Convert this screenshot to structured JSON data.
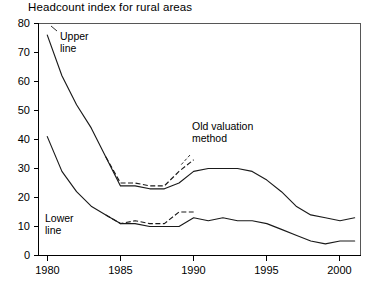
{
  "chart_data": {
    "type": "line",
    "title": "Headcount index for rural areas",
    "xlabel": "",
    "ylabel": "",
    "xlim": [
      1979.4,
      2001.4
    ],
    "ylim": [
      0,
      80
    ],
    "xticks": [
      1980,
      1985,
      1990,
      1995,
      2000
    ],
    "yticks": [
      0,
      10,
      20,
      30,
      40,
      50,
      60,
      70,
      80
    ],
    "grid": false,
    "legend_position": "none",
    "annotations": [
      {
        "text_line1": "Upper",
        "text_line2": "line",
        "x": 1981.0,
        "y": 73
      },
      {
        "text_line1": "Old valuation",
        "text_line2": "method",
        "x": 1989.5,
        "y": 44
      },
      {
        "text_line1": "Lower",
        "text_line2": "line",
        "x": 1980.8,
        "y": 11
      }
    ],
    "series": [
      {
        "name": "Upper line",
        "style": "solid",
        "x": [
          1980,
          1981,
          1982,
          1983,
          1984,
          1985,
          1986,
          1987,
          1988,
          1989,
          1990,
          1991,
          1992,
          1993,
          1994,
          1995,
          1996,
          1997,
          1998,
          1999,
          2000,
          2001
        ],
        "values": [
          76,
          62,
          52,
          44,
          34,
          24,
          24,
          23,
          23,
          25,
          29,
          30,
          30,
          30,
          29,
          26,
          22,
          17,
          14,
          13,
          12,
          13
        ]
      },
      {
        "name": "Upper line (old valuation method)",
        "style": "dashed",
        "x": [
          1984,
          1985,
          1986,
          1987,
          1988,
          1989,
          1990
        ],
        "values": [
          34,
          25,
          25,
          24,
          24,
          29,
          33
        ]
      },
      {
        "name": "Lower line",
        "style": "solid",
        "x": [
          1980,
          1981,
          1982,
          1983,
          1984,
          1985,
          1986,
          1987,
          1988,
          1989,
          1990,
          1991,
          1992,
          1993,
          1994,
          1995,
          1996,
          1997,
          1998,
          1999,
          2000,
          2001
        ],
        "values": [
          41,
          29,
          22,
          17,
          14,
          11,
          11,
          10,
          10,
          10,
          13,
          12,
          13,
          12,
          12,
          11,
          9,
          7,
          5,
          4,
          5,
          5
        ]
      },
      {
        "name": "Lower line (old valuation method)",
        "style": "dashed",
        "x": [
          1984,
          1985,
          1986,
          1987,
          1988,
          1989,
          1990
        ],
        "values": [
          14,
          11,
          12,
          11,
          11,
          15,
          15
        ]
      }
    ]
  },
  "axes": {
    "y_tick_labels": [
      "80",
      "70",
      "60",
      "50",
      "40",
      "30",
      "20",
      "10",
      "0"
    ],
    "x_tick_labels": [
      "1980",
      "1985",
      "1990",
      "1995",
      "2000"
    ]
  },
  "annotation_labels": {
    "upper_line_1": "Upper",
    "upper_line_2": "line",
    "old_method_1": "Old valuation",
    "old_method_2": "method",
    "lower_line_1": "Lower",
    "lower_line_2": "line"
  }
}
